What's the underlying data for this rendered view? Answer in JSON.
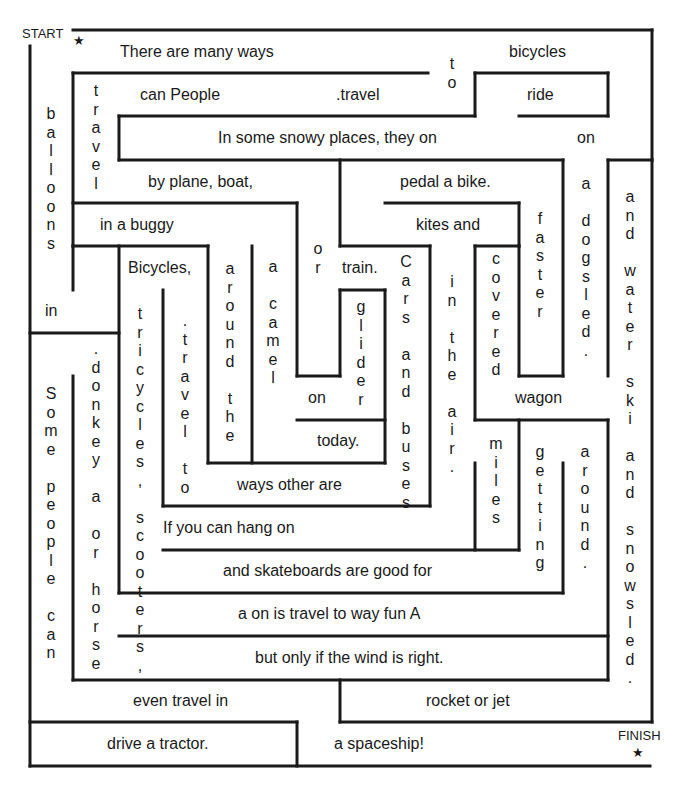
{
  "markers": {
    "start": "START",
    "finish": "FINISH",
    "star": "★"
  },
  "horizontal_phrases": {
    "there_are_many_ways": "There are many ways",
    "bicycles": "bicycles",
    "can_people": "can People",
    "travel_dot": ".travel",
    "ride": "ride",
    "in_some_snowy": "In some snowy places, they on",
    "on_right": "on",
    "by_plane_boat": "by plane, boat,",
    "pedal_a_bike": "pedal a bike.",
    "in_a_buggy": "in a buggy",
    "kites_and": "kites and",
    "bicycles_comma": "Bicycles,",
    "train": "train.",
    "in_left": "in",
    "on_mid": "on",
    "today": "today.",
    "wagon": "wagon",
    "ways_other_are": "ways other are",
    "if_you_can_hang_on": "If you can hang on",
    "and_skateboards": "and skateboards are good for",
    "a_on_is_travel": "a on is travel to way fun A",
    "but_only_if": "but only if the wind is right.",
    "even_travel_in": "even travel in",
    "rocket_or_jet": "rocket or jet",
    "drive_a_tractor": "drive a tractor.",
    "a_spaceship": "a spaceship!"
  },
  "vertical_phrases": {
    "to_top": "to",
    "travel_left": "travel",
    "balloons": "balloons",
    "a_dogsled": "a dogsled.",
    "and_water_ski": "and water ski and snowsled.",
    "faster": "faster",
    "or": "or",
    "around_the": "around the",
    "a_camel": "a camel",
    "glider": "glider",
    "cars_and_buses": "Cars and buses",
    "in_the_air": "in the air.",
    "covered": "covered",
    "tricycles_scooters": "tricycles, scooters,",
    "travel_to": ".travel to",
    "donkey_or_horse": ".donkey a or horse",
    "some_people_can": "Some people can",
    "miles": "miles",
    "getting": "getting",
    "around_dot": "around."
  }
}
